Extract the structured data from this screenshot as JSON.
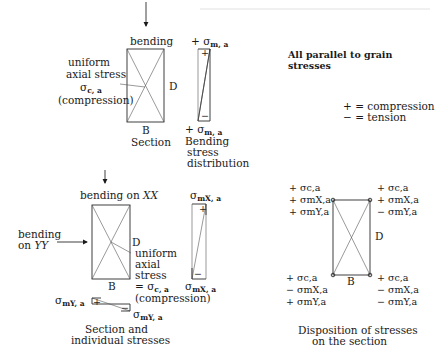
{
  "top_section": {
    "load_label": "bending",
    "axial_label": [
      "uniform",
      "axial stress"
    ],
    "axial_symbol": "σ",
    "axial_sub": "c, a",
    "axial_note": "(compression)",
    "depth_label": "D",
    "breadth_label": "B",
    "caption": "Section",
    "dist_top_sign": "+",
    "dist_top_symbol": "σ",
    "dist_top_sub": "m, a",
    "dist_bottom_sign": "+",
    "dist_bottom_symbol": "σ",
    "dist_bottom_sub": "m, a",
    "dist_plus": "+",
    "dist_minus": "−",
    "dist_caption": [
      "Bending",
      "stress",
      "distribution"
    ]
  },
  "notes": {
    "title": [
      "All parallel to grain",
      "stresses"
    ],
    "legend": [
      {
        "sign": "+",
        "meaning": "= compression"
      },
      {
        "sign": "−",
        "meaning": "= tension"
      }
    ]
  },
  "lower_section": {
    "bending_xx": "bending on XX",
    "bending_yy": [
      "bending",
      "on YY"
    ],
    "depth_label": "D",
    "breadth_label": "B",
    "axial_label": [
      "uniform",
      "axial",
      "stress"
    ],
    "axial_eq": "= σ",
    "axial_sub": "c, a",
    "axial_note": "(compression)",
    "mx_top": "σ",
    "mx_top_sub": "mX, a",
    "mx_bottom": "σ",
    "mx_bottom_sub": "mX, a",
    "my_left": "σ",
    "my_left_sub": "mY, a",
    "my_right": "σ",
    "my_right_sub": "mY, a",
    "caption": [
      "Section and",
      "individual stresses"
    ]
  },
  "disposition": {
    "corners": {
      "top_left": [
        "+ σc,a",
        "+ σmX,a",
        "+ σmY,a"
      ],
      "top_right": [
        "+ σc,a",
        "+ σmX,a",
        "− σmY,a"
      ],
      "bottom_left": [
        "+ σc,a",
        "− σmX,a",
        "+ σmY,a"
      ],
      "bottom_right": [
        "+ σc,a",
        "− σmX,a",
        "− σmY,a"
      ]
    },
    "depth_label": "D",
    "breadth_label": "B",
    "caption": [
      "Disposition of stresses",
      "on the section"
    ]
  }
}
